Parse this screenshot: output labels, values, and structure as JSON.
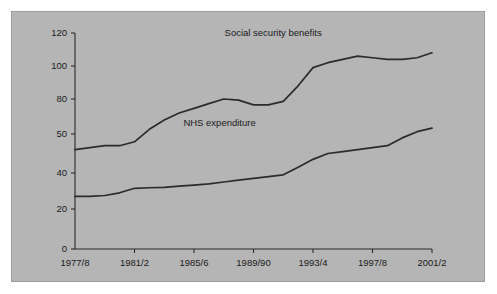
{
  "chart_data": {
    "type": "line",
    "title": "",
    "subtitle": "",
    "xlabel": "",
    "ylabel": "",
    "grid": false,
    "legend_position": "inline-labels",
    "background_color": "#b5b5b5",
    "line_color": "#2b2b2b",
    "ylim": [
      0,
      120
    ],
    "y_ticks": [
      0,
      20,
      40,
      50,
      80,
      100,
      120
    ],
    "y_tick_labels": [
      "0",
      "20",
      "40",
      "50",
      "80",
      "100",
      "120"
    ],
    "y_axis_note": "irregular non-linear tick spacing as drawn",
    "x_ticks": [
      "1977/8",
      "1981/2",
      "1985/6",
      "1989/90",
      "1993/4",
      "1997/8",
      "2001/2"
    ],
    "x_tick_labels": [
      "1977/8",
      "1981/2",
      "1985/6",
      "1989/90",
      "1993/4",
      "1997/8",
      "2001/2"
    ],
    "annotations": [
      {
        "text": "Social security benefits",
        "x_frac": 0.555,
        "y_value": 118
      },
      {
        "text": "NHS expenditure",
        "x_frac": 0.405,
        "y_value": 57
      }
    ],
    "series": [
      {
        "name": "Social security benefits",
        "x": [
          "1977/8",
          "1978/9",
          "1979/80",
          "1980/1",
          "1981/2",
          "1982/3",
          "1983/4",
          "1984/5",
          "1985/6",
          "1986/7",
          "1987/8",
          "1988/9",
          "1989/90",
          "1990/1",
          "1991/2",
          "1992/3",
          "1993/4",
          "1994/5",
          "1995/6",
          "1996/7",
          "1997/8",
          "1998/9",
          "1999/00",
          "2000/1",
          "2001/2"
        ],
        "values": [
          46,
          46.5,
          47,
          47,
          48,
          54,
          62,
          68,
          72,
          76,
          80,
          79,
          75,
          75,
          78,
          88,
          99,
          102,
          104,
          106,
          105,
          104,
          104,
          105,
          108
        ]
      },
      {
        "name": "NHS expenditure",
        "x": [
          "1977/8",
          "1978/9",
          "1979/80",
          "1980/1",
          "1981/2",
          "1982/3",
          "1983/4",
          "1984/5",
          "1985/6",
          "1986/7",
          "1987/8",
          "1988/9",
          "1989/90",
          "1990/1",
          "1991/2",
          "1992/3",
          "1993/4",
          "1994/5",
          "1995/6",
          "1996/7",
          "1997/8",
          "1998/9",
          "1999/00",
          "2000/1",
          "2001/2"
        ],
        "values": [
          27,
          27,
          27.5,
          29,
          31.5,
          31.8,
          32,
          32.7,
          33.3,
          34,
          35,
          36,
          37,
          38,
          39,
          41.5,
          43.5,
          45,
          45.5,
          46,
          46.5,
          47,
          49,
          52,
          55
        ]
      }
    ]
  }
}
